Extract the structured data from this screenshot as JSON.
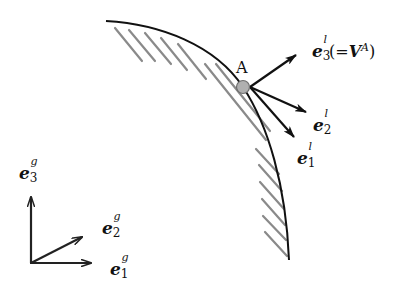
{
  "diagram": {
    "type": "vector-frame-diagram",
    "colors": {
      "line": "#111111",
      "hatch": "#8a8a8a",
      "point_fill": "#b0b0b0",
      "point_stroke": "#6e6e6e"
    },
    "point": {
      "label": "A"
    },
    "local_frame": {
      "e3": {
        "base": "e",
        "sub": "3",
        "sup": "l",
        "note_open": "(=",
        "note_vec": "V",
        "note_sup": "A",
        "note_close": ")"
      },
      "e2": {
        "base": "e",
        "sub": "2",
        "sup": "l"
      },
      "e1": {
        "base": "e",
        "sub": "1",
        "sup": "l"
      }
    },
    "global_frame": {
      "e3": {
        "base": "e",
        "sub": "3",
        "sup": "g"
      },
      "e2": {
        "base": "e",
        "sub": "2",
        "sup": "g"
      },
      "e1": {
        "base": "e",
        "sub": "1",
        "sup": "g"
      }
    }
  }
}
